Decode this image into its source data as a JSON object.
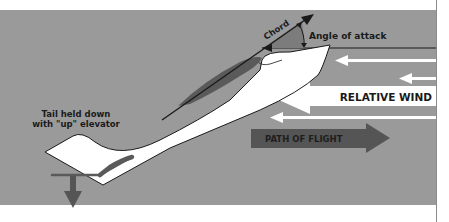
{
  "diagram": {
    "labels": {
      "chord": "Chord",
      "angle_of_attack": "Angle of attack",
      "relative_wind": "RELATIVE WIND",
      "path_of_flight": "PATH OF FLIGHT",
      "tail_line1": "Tail held down",
      "tail_line2": "with \"up\" elevator"
    },
    "colors": {
      "background": "#9a9a9a",
      "page": "#ffffff",
      "aircraft": "#ffffff",
      "outline": "#1a1a1a",
      "wing": "#5a5a5a",
      "angle_wedge": "#7c7c7c",
      "path_arrow": "#555555",
      "wind_arrow": "#ffffff"
    },
    "icons": {
      "down_force_arrow": "down-arrow-icon",
      "chord_arrow": "arrow-up-right-icon",
      "relative_wind_arrows": "arrow-left-icon",
      "path_of_flight_arrow": "arrow-right-icon"
    }
  }
}
